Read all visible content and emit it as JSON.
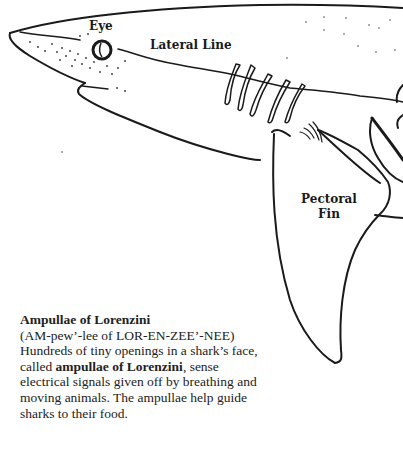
{
  "labels": {
    "eye": "Eye",
    "lateral_line": "Lateral Line",
    "pectoral_fin_line1": "Pectoral",
    "pectoral_fin_line2": "Fin"
  },
  "caption": {
    "title": "Ampullae of Lorenzini",
    "pronunciation": "(AM-pew’-lee of LOR-EN-ZEE’-NEE)",
    "body_part1": "Hundreds of tiny openings in a shark’s face, called ",
    "body_bold1": "ampullae of Lorenzini",
    "body_part2": ", sense electrical signals given off by breathing and moving animals. The ampullae help guide sharks to their food."
  },
  "colors": {
    "ink": "#1a1a1a",
    "background": "#ffffff"
  }
}
